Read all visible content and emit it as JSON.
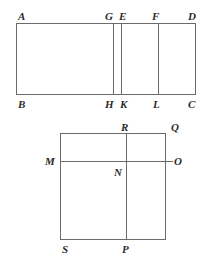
{
  "figure": {
    "stroke_color": "#6b6b6b",
    "label_color": "#2b2b2b",
    "background_color": "#ffffff",
    "stroke_width": 1,
    "top_figure": {
      "name": "rectangle-abcd",
      "description": "Rectangle ABCD with three interior vertical segments GH, EK and FL",
      "outline": {
        "x": 16,
        "y": 23,
        "width": 180,
        "height": 72
      },
      "interior_segments": [
        {
          "name": "segment-gh",
          "x": 113
        },
        {
          "name": "segment-ek",
          "x": 121
        },
        {
          "name": "segment-fl",
          "x": 158
        }
      ],
      "labels": [
        {
          "id": "A",
          "text": "A",
          "x": 18,
          "y": 11
        },
        {
          "id": "G",
          "text": "G",
          "x": 105,
          "y": 11
        },
        {
          "id": "E",
          "text": "E",
          "x": 119,
          "y": 11
        },
        {
          "id": "F",
          "text": "F",
          "x": 152,
          "y": 11
        },
        {
          "id": "D",
          "text": "D",
          "x": 188,
          "y": 11
        },
        {
          "id": "B",
          "text": "B",
          "x": 18,
          "y": 99
        },
        {
          "id": "H",
          "text": "H",
          "x": 105,
          "y": 99
        },
        {
          "id": "K",
          "text": "K",
          "x": 120,
          "y": 99
        },
        {
          "id": "L",
          "text": "L",
          "x": 153,
          "y": 99
        },
        {
          "id": "C",
          "text": "C",
          "x": 188,
          "y": 99
        }
      ]
    },
    "bottom_figure": {
      "name": "square-sqrp",
      "description": "Square with interior vertical segment RP and horizontal segment MO meeting at N",
      "outline": {
        "x": 60,
        "y": 133,
        "width": 106,
        "height": 107
      },
      "interior_segments": [
        {
          "name": "segment-rp-vertical",
          "x": 126,
          "y1": 133,
          "y2": 240
        },
        {
          "name": "segment-mo-horizontal",
          "y": 161,
          "x1": 60,
          "x2": 173
        }
      ],
      "labels": [
        {
          "id": "R",
          "text": "R",
          "x": 121,
          "y": 122
        },
        {
          "id": "Q",
          "text": "Q",
          "x": 171,
          "y": 122
        },
        {
          "id": "M",
          "text": "M",
          "x": 45,
          "y": 156
        },
        {
          "id": "O",
          "text": "O",
          "x": 174,
          "y": 156
        },
        {
          "id": "N",
          "text": "N",
          "x": 114,
          "y": 167
        },
        {
          "id": "S",
          "text": "S",
          "x": 62,
          "y": 244
        },
        {
          "id": "P",
          "text": "P",
          "x": 122,
          "y": 244
        }
      ]
    }
  }
}
